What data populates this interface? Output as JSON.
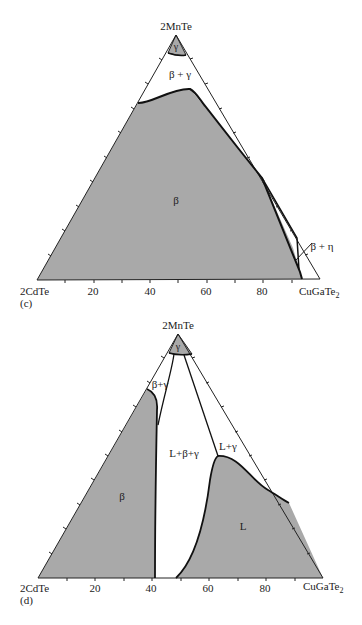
{
  "colors": {
    "phase_fill": "#a9a9a9",
    "line": "#222222",
    "background": "#ffffff"
  },
  "diagrams": [
    {
      "panel": "(c)",
      "apex_label": "2MnTe",
      "left_label": "2CdTe",
      "right_label": "CuGaTe",
      "right_sub": "2",
      "ticks": [
        "20",
        "40",
        "60",
        "80"
      ],
      "regions": {
        "gamma": "γ",
        "beta_gamma": "β + γ",
        "beta": "β",
        "beta_eta": "β + η"
      }
    },
    {
      "panel": "(d)",
      "apex_label": "2MnTe",
      "left_label": "2CdTe",
      "right_label": "CuGaTe",
      "right_sub": "2",
      "ticks": [
        "20",
        "40",
        "60",
        "80"
      ],
      "regions": {
        "gamma": "γ",
        "beta_gamma": "β+γ",
        "beta": "β",
        "l_beta_gamma": "L+β+γ",
        "l_gamma": "L+γ",
        "l": "L"
      }
    }
  ]
}
